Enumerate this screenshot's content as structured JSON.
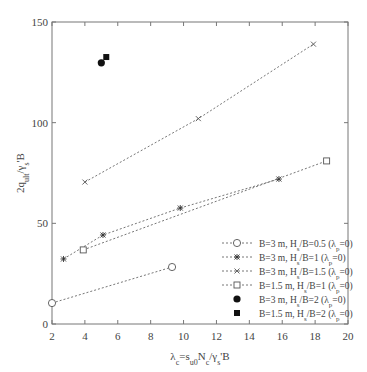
{
  "chart_data": {
    "type": "line",
    "title": "",
    "xlabel": "λc=su0Nc/γs'B",
    "ylabel": "2qult/γs'B",
    "xlim": [
      2,
      20
    ],
    "ylim": [
      0,
      150
    ],
    "xticks": [
      2,
      4,
      6,
      8,
      10,
      12,
      14,
      16,
      18,
      20
    ],
    "yticks": [
      0,
      50,
      100,
      150
    ],
    "grid": false,
    "legend_position": "lower right",
    "series": [
      {
        "name": "B=3 m, Hs/B=0.5 (λp=0)",
        "marker": "circle-open",
        "line": "dotted",
        "x": [
          2.0,
          9.3
        ],
        "y": [
          10.4,
          28.3
        ]
      },
      {
        "name": "B=3 m, Hs/B=1 (λp=0)",
        "marker": "star",
        "line": "dotted",
        "x": [
          2.7,
          5.1,
          9.8,
          15.8
        ],
        "y": [
          32.3,
          44.2,
          57.6,
          72.0
        ]
      },
      {
        "name": "B=3 m, Hs/B=1.5 (λp=0)",
        "marker": "x",
        "line": "dotted",
        "x": [
          4.0,
          10.9,
          17.9
        ],
        "y": [
          70.5,
          102.0,
          139.0
        ]
      },
      {
        "name": "B=1.5 m, Hs/B=1 (λp=0)",
        "marker": "square-open",
        "line": "dotted",
        "x": [
          3.9,
          18.7
        ],
        "y": [
          36.8,
          81.0
        ]
      },
      {
        "name": "B=3 m, Hs/B=2 (λp=0)",
        "marker": "circle-filled",
        "line": "none",
        "x": [
          5.0
        ],
        "y": [
          129.7
        ]
      },
      {
        "name": "B=1.5 m, Hs/B=2 (λp=0)",
        "marker": "square-filled",
        "line": "none",
        "x": [
          5.3
        ],
        "y": [
          132.6
        ]
      }
    ]
  },
  "legend": [
    {
      "pre": "B=3 m, H",
      "sub": "s",
      "mid": "/B=0.5 (λ",
      "sub2": "p",
      "post": "=0)"
    },
    {
      "pre": "B=3 m, H",
      "sub": "s",
      "mid": "/B=1 (λ",
      "sub2": "p",
      "post": "=0)"
    },
    {
      "pre": "B=3 m, H",
      "sub": "s",
      "mid": "/B=1.5 (λ",
      "sub2": "p",
      "post": "=0)"
    },
    {
      "pre": "B=1.5 m, H",
      "sub": "s",
      "mid": "/B=1 (λ",
      "sub2": "p",
      "post": "=0)"
    },
    {
      "pre": "B=3 m, H",
      "sub": "s",
      "mid": "/B=2 (λ",
      "sub2": "p",
      "post": "=0)"
    },
    {
      "pre": "B=1.5 m, H",
      "sub": "s",
      "mid": "/B=2 (λ",
      "sub2": "p",
      "post": "=0)"
    }
  ],
  "axis_labels": {
    "x": {
      "a": "λ",
      "a_sub": "c",
      "b": "=s",
      "b_sub": "u0",
      "c": "N",
      "c_sub": "c",
      "d": "/γ",
      "d_sub": "s",
      "e": "'B"
    },
    "y": {
      "a": "2q",
      "a_sub": "ult",
      "b": "/γ",
      "b_sub": "s",
      "c": "'B"
    }
  }
}
